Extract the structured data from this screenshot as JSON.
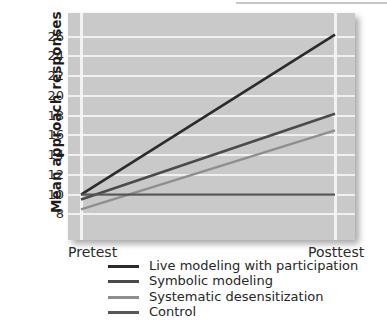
{
  "chart_data": {
    "type": "line",
    "title": "",
    "subtitle": "",
    "xlabel": "",
    "ylabel": "Mean approach responses",
    "x": [
      "Pretest",
      "Posttest"
    ],
    "xtick_labels": [
      "Pretest",
      "Posttest"
    ],
    "ytick_labels": [
      "8",
      "10",
      "12",
      "14",
      "16",
      "18",
      "20",
      "22",
      "24",
      "26"
    ],
    "ytick_values": [
      8,
      10,
      12,
      14,
      16,
      18,
      20,
      22,
      24,
      26
    ],
    "ylim": [
      5.4,
      28.4
    ],
    "grid": "horizontal-and-vertical",
    "grid_color": "#f2f2f2",
    "plot_background": "#c9c9c9",
    "legend_position": "below-axes",
    "series": [
      {
        "name": "Live modeling with participation",
        "values": [
          10.0,
          26.2
        ],
        "color": "#2b2b2b",
        "width": 2.6
      },
      {
        "name": "Symbolic modeling",
        "values": [
          9.5,
          18.2
        ],
        "color": "#4a4a4a",
        "width": 2.6
      },
      {
        "name": "Systematic desensitization",
        "values": [
          8.5,
          16.5
        ],
        "color": "#8e8e8e",
        "width": 2.4
      },
      {
        "name": "Control",
        "values": [
          10.0,
          10.0
        ],
        "color": "#575757",
        "width": 2.4
      }
    ]
  },
  "legend": {
    "items": [
      {
        "label": "Live modeling with participation",
        "color": "#2b2b2b"
      },
      {
        "label": "Symbolic modeling",
        "color": "#4a4a4a"
      },
      {
        "label": "Systematic desensitization",
        "color": "#8e8e8e"
      },
      {
        "label": "Control",
        "color": "#575757"
      }
    ]
  },
  "axes": {
    "y_title": "Mean approach responses",
    "y_labels": [
      "26",
      "24",
      "22",
      "20",
      "18",
      "16",
      "14",
      "12",
      "10",
      "8"
    ],
    "x_labels": [
      "Pretest",
      "Posttest"
    ]
  }
}
